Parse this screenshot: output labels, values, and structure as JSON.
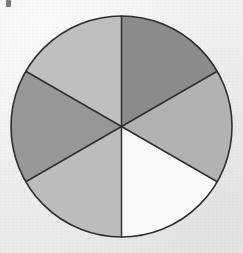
{
  "figure": {
    "caption": "",
    "background_color": "#f1f0ee",
    "outline_color": "#2e2e2c",
    "outline_width": 1.6,
    "divider_color": "#2e2e2c",
    "divider_width": 1.5,
    "canvas": {
      "width": 243,
      "height": 253
    }
  },
  "artifact": {
    "name": "scan-speck",
    "x": 6,
    "y": 0,
    "color": "#4a4a48"
  },
  "chart_data": {
    "type": "pie",
    "subtitle": "",
    "xlabel": "",
    "ylabel": "",
    "legend_position": "none",
    "grid": false,
    "center_x": 121.5,
    "center_y": 126.5,
    "radius": 110.5,
    "total_sectors": 6,
    "sector_angle_degrees": 60,
    "start_angle_degrees": -90,
    "categories": [
      "sector-1-top-right",
      "sector-2-right",
      "sector-3-bottom-right",
      "sector-4-bottom-left",
      "sector-5-left",
      "sector-6-top-left"
    ],
    "values": [
      60,
      60,
      60,
      60,
      60,
      60
    ],
    "fractions": [
      "1/6",
      "1/6",
      "1/6",
      "1/6",
      "1/6",
      "1/6"
    ],
    "percentages": [
      16.7,
      16.7,
      16.7,
      16.7,
      16.7,
      16.7
    ],
    "colors": [
      "#8b8b89",
      "#b2b2b0",
      "#fbfaf8",
      "#bcbcba",
      "#979795",
      "#bfbfbd"
    ],
    "shading_labels": [
      "dark gray",
      "medium gray",
      "white / unshaded",
      "light gray",
      "medium-dark gray",
      "light gray"
    ],
    "sectors": [
      {
        "index": 1,
        "name": "top-right",
        "start_deg": -90,
        "end_deg": -30,
        "color": "#8b8b89",
        "shade": "dark gray"
      },
      {
        "index": 2,
        "name": "right",
        "start_deg": -30,
        "end_deg": 30,
        "color": "#b2b2b0",
        "shade": "medium gray"
      },
      {
        "index": 3,
        "name": "bottom-right",
        "start_deg": 30,
        "end_deg": 90,
        "color": "#fbfaf8",
        "shade": "white / unshaded"
      },
      {
        "index": 4,
        "name": "bottom-left",
        "start_deg": 90,
        "end_deg": 150,
        "color": "#bcbcba",
        "shade": "light gray"
      },
      {
        "index": 5,
        "name": "left",
        "start_deg": 150,
        "end_deg": 210,
        "color": "#979795",
        "shade": "medium-dark gray"
      },
      {
        "index": 6,
        "name": "top-left",
        "start_deg": 210,
        "end_deg": 270,
        "color": "#bfbfbd",
        "shade": "light gray"
      }
    ]
  }
}
